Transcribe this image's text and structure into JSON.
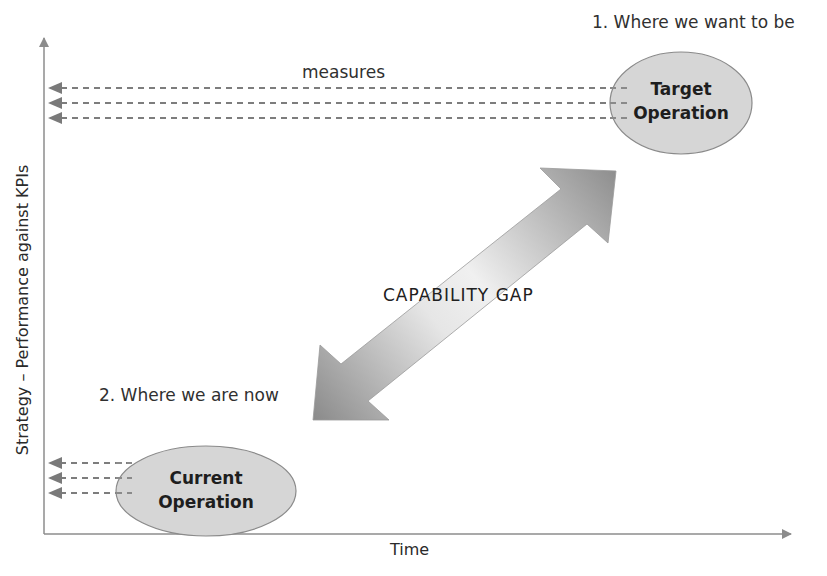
{
  "diagram": {
    "type": "capability-gap",
    "axes": {
      "x_label": "Time",
      "y_label": "Strategy – Performance against KPIs"
    },
    "target": {
      "caption": "1. Where we want to be",
      "line1": "Target",
      "line2": "Operation"
    },
    "current": {
      "caption": "2. Where we are now",
      "line1": "Current",
      "line2": "Operation"
    },
    "measures_label": "measures",
    "gap_label": "CAPABILITY GAP",
    "colors": {
      "axis": "#8c8c8c",
      "dash": "#7d7d7d",
      "ellipse_fill": "#d6d6d6",
      "ellipse_stroke": "#8a8a8a",
      "arrow_dark": "#8f8f8f",
      "arrow_light": "#f2f2f2"
    }
  }
}
